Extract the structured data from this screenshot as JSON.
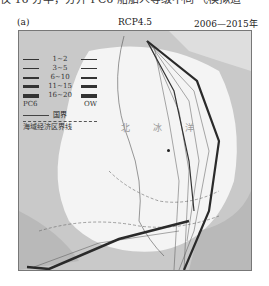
{
  "page": {
    "top_text_fragment": "仅 16 分半，分开 PC6 船舶人等级不同 飞模拟道"
  },
  "figure": {
    "panel_label": "(a)",
    "scenario": "RCP4.5",
    "period": "2006—2015年",
    "map": {
      "ocean_label": "北 冰 洋",
      "colors": {
        "land": "#c9c9c9",
        "sea_ice": "#f4f4f4",
        "open_water": "#b9b9b9",
        "route": "#2a2a2a"
      }
    },
    "legend": {
      "classes": [
        {
          "label": "1~2",
          "width": 1
        },
        {
          "label": "3~5",
          "width": 1.5
        },
        {
          "label": "6~10",
          "width": 2
        },
        {
          "label": "11~15",
          "width": 3
        },
        {
          "label": "16~20",
          "width": 4
        }
      ],
      "left_column": "PC6",
      "right_column": "OW",
      "national_border": "国界",
      "eez_boundary": "海域经济区界线"
    }
  }
}
